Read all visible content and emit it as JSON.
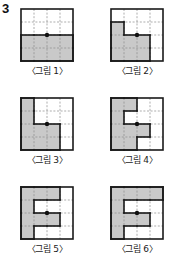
{
  "problem": {
    "number": "3"
  },
  "colors": {
    "shade": "#c9c9c9",
    "outline": "#1a1a1a",
    "gridline": "#8a8a8a",
    "dot": "#111111",
    "background": "#ffffff"
  },
  "grid": {
    "rows": 4,
    "cols": 4,
    "cell_px": 13
  },
  "figures": [
    {
      "id": "figure-1",
      "caption": "〈그림 1〉",
      "shaded_cells": [
        [
          2,
          0
        ],
        [
          2,
          1
        ],
        [
          2,
          2
        ],
        [
          2,
          3
        ],
        [
          3,
          0
        ],
        [
          3,
          1
        ],
        [
          3,
          2
        ],
        [
          3,
          3
        ]
      ],
      "dot": [
        2,
        2
      ]
    },
    {
      "id": "figure-2",
      "caption": "〈그림 2〉",
      "shaded_cells": [
        [
          1,
          0
        ],
        [
          2,
          0
        ],
        [
          2,
          1
        ],
        [
          2,
          2
        ],
        [
          3,
          0
        ],
        [
          3,
          1
        ],
        [
          3,
          2
        ]
      ],
      "dot": [
        2,
        2
      ]
    },
    {
      "id": "figure-3",
      "caption": "〈그림 3〉",
      "shaded_cells": [
        [
          0,
          0
        ],
        [
          1,
          0
        ],
        [
          2,
          0
        ],
        [
          2,
          1
        ],
        [
          2,
          2
        ],
        [
          3,
          0
        ],
        [
          3,
          1
        ],
        [
          3,
          2
        ]
      ],
      "dot": [
        2,
        2
      ]
    },
    {
      "id": "figure-4",
      "caption": "〈그림 4〉",
      "shaded_cells": [
        [
          0,
          0
        ],
        [
          0,
          1
        ],
        [
          1,
          0
        ],
        [
          2,
          0
        ],
        [
          2,
          1
        ],
        [
          2,
          2
        ],
        [
          3,
          0
        ],
        [
          3,
          1
        ]
      ],
      "dot": [
        2,
        2
      ]
    },
    {
      "id": "figure-5",
      "caption": "〈그림 5〉",
      "shaded_cells": [
        [
          0,
          0
        ],
        [
          0,
          1
        ],
        [
          0,
          2
        ],
        [
          1,
          0
        ],
        [
          2,
          0
        ],
        [
          2,
          1
        ],
        [
          2,
          2
        ],
        [
          3,
          0
        ]
      ],
      "dot": [
        2,
        2
      ]
    },
    {
      "id": "figure-6",
      "caption": "〈그림 6〉",
      "shaded_cells": [
        [
          0,
          0
        ],
        [
          0,
          1
        ],
        [
          0,
          2
        ],
        [
          0,
          3
        ],
        [
          1,
          0
        ],
        [
          2,
          0
        ],
        [
          2,
          1
        ],
        [
          2,
          2
        ],
        [
          3,
          0
        ]
      ],
      "dot": [
        2,
        2
      ]
    }
  ],
  "layout": {
    "positions": [
      {
        "left": 20,
        "top": 8
      },
      {
        "left": 110,
        "top": 8
      },
      {
        "left": 20,
        "top": 97
      },
      {
        "left": 110,
        "top": 97
      },
      {
        "left": 20,
        "top": 186
      },
      {
        "left": 110,
        "top": 186
      }
    ]
  }
}
